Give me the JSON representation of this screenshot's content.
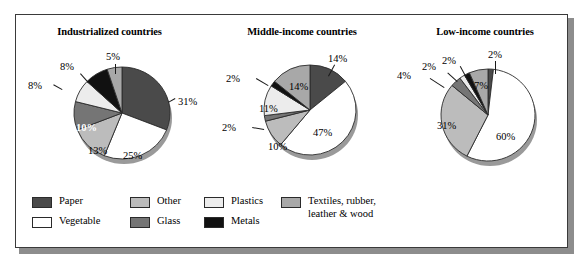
{
  "figure": {
    "frame_border_color": "#3a3a3a",
    "shadow_color": "#8d8d8d"
  },
  "legend": {
    "items": [
      {
        "label": "Paper",
        "color": "#4a4a4a"
      },
      {
        "label": "Vegetable",
        "color": "#ffffff"
      },
      {
        "label": "Other",
        "color": "#bcbcbc"
      },
      {
        "label": "Glass",
        "color": "#757575"
      },
      {
        "label": "Plastics",
        "color": "#ececec"
      },
      {
        "label": "Metals",
        "color": "#111111"
      },
      {
        "label": "Textiles, rubber,\nleather & wood",
        "color": "#a8a8a8"
      }
    ]
  },
  "chart_data": [
    {
      "type": "pie",
      "title": "Industrialized countries",
      "categories": [
        "Paper",
        "Vegetable",
        "Other",
        "Glass",
        "Plastics",
        "Metals",
        "Textiles, rubber, leather & wood"
      ],
      "values": [
        31,
        25,
        13,
        10,
        8,
        8,
        5
      ],
      "value_labels": [
        "31%",
        "25%",
        "13%",
        "10%",
        "8%",
        "8%",
        "5%"
      ],
      "colors": [
        "#4a4a4a",
        "#ffffff",
        "#bcbcbc",
        "#757575",
        "#ececec",
        "#111111",
        "#a8a8a8"
      ],
      "start_angle_deg": 0,
      "units": "percent"
    },
    {
      "type": "pie",
      "title": "Middle-income countries",
      "categories": [
        "Paper",
        "Vegetable",
        "Other",
        "Glass",
        "Plastics",
        "Metals",
        "Textiles, rubber, leather & wood"
      ],
      "values": [
        14,
        47,
        10,
        2,
        11,
        2,
        14
      ],
      "value_labels": [
        "14%",
        "47%",
        "10%",
        "2%",
        "11%",
        "2%",
        "14%"
      ],
      "colors": [
        "#4a4a4a",
        "#ffffff",
        "#bcbcbc",
        "#757575",
        "#ececec",
        "#111111",
        "#a8a8a8"
      ],
      "start_angle_deg": 0,
      "units": "percent"
    },
    {
      "type": "pie",
      "title": "Low-income countries",
      "categories": [
        "Paper",
        "Vegetable",
        "Other",
        "Glass",
        "Plastics",
        "Metals",
        "Textiles, rubber, leather & wood"
      ],
      "values": [
        2,
        60,
        31,
        4,
        2,
        2,
        7
      ],
      "value_labels": [
        "2%",
        "60%",
        "31%",
        "4%",
        "2%",
        "2%",
        "7%"
      ],
      "colors": [
        "#4a4a4a",
        "#ffffff",
        "#bcbcbc",
        "#757575",
        "#ececec",
        "#111111",
        "#a8a8a8"
      ],
      "start_angle_deg": 0,
      "units": "percent"
    }
  ]
}
